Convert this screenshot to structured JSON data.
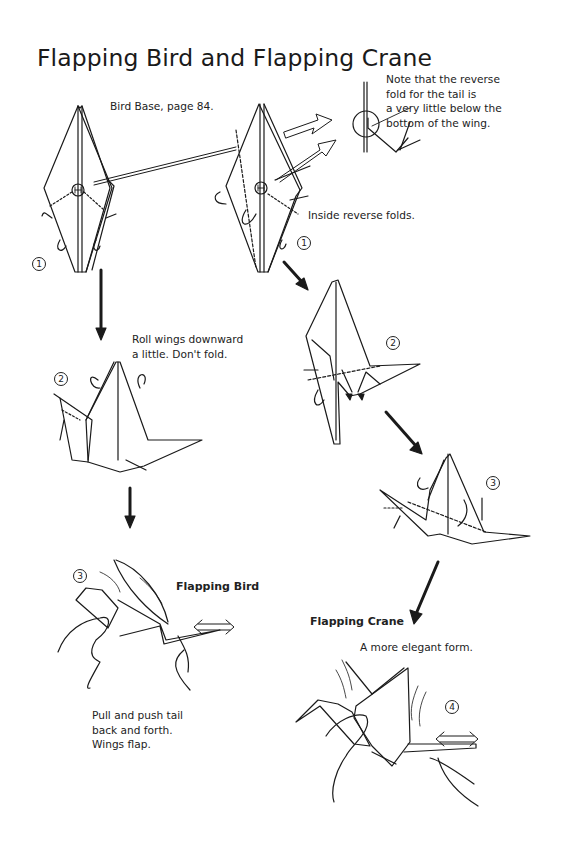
{
  "page": {
    "title": "Flapping Bird and Flapping Crane"
  },
  "captions": {
    "bird_base": "Bird Base, page 84.",
    "note_line1": "Note that the reverse",
    "note_line2": "fold for the tail is",
    "note_line3": "a very little below the",
    "note_line4": "bottom of the wing.",
    "inside_reverse": "Inside reverse folds.",
    "roll_line1": "Roll wings downward",
    "roll_line2": "a little. Don't fold.",
    "flapping_bird": "Flapping Bird",
    "pull_line1": "Pull and push tail",
    "pull_line2": "back and forth.",
    "pull_line3": "Wings flap.",
    "flapping_crane": "Flapping Crane",
    "elegant": "A more elegant form."
  },
  "step_numbers": {
    "bird_step1": "1",
    "bird_step2": "2",
    "bird_step3": "3",
    "crane_step1": "1",
    "crane_step2": "2",
    "crane_step3": "3",
    "crane_step4": "4"
  },
  "colors": {
    "ink": "#1a1a1a",
    "paper": "#ffffff"
  }
}
